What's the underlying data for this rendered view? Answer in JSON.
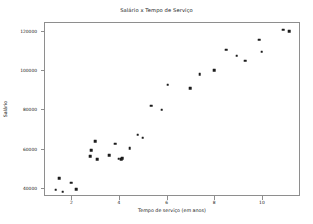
{
  "chart_data": {
    "type": "scatter",
    "title": "Salário x Tempo de Serviço",
    "xlabel": "Tempo de serviço (em anos)",
    "ylabel": "Salário",
    "xlim": [
      0.85,
      11.6
    ],
    "ylim": [
      36000,
      124500
    ],
    "grid": false,
    "legend": null,
    "marker": {
      "shape": "square",
      "color": "#1c1c1c",
      "size": 2.6
    },
    "xticks": [
      2,
      4,
      6,
      8,
      10
    ],
    "xtick_labels": [
      "2",
      "4",
      "6",
      "8",
      "10"
    ],
    "yticks": [
      40000,
      60000,
      80000,
      100000,
      120000
    ],
    "ytick_labels": [
      "40000",
      "60000",
      "80000",
      "100000",
      "120000"
    ],
    "series": [
      {
        "name": "funcionarios",
        "points": [
          {
            "x": 1.3,
            "y": 39800
          },
          {
            "x": 1.45,
            "y": 45600
          },
          {
            "x": 1.6,
            "y": 38600
          },
          {
            "x": 1.95,
            "y": 43300
          },
          {
            "x": 2.15,
            "y": 40000
          },
          {
            "x": 2.75,
            "y": 56700
          },
          {
            "x": 2.8,
            "y": 59900
          },
          {
            "x": 2.95,
            "y": 64400
          },
          {
            "x": 3.05,
            "y": 55100
          },
          {
            "x": 3.55,
            "y": 57300
          },
          {
            "x": 3.8,
            "y": 63200
          },
          {
            "x": 3.95,
            "y": 55400
          },
          {
            "x": 4.05,
            "y": 55300
          },
          {
            "x": 4.1,
            "y": 55600
          },
          {
            "x": 4.4,
            "y": 60800
          },
          {
            "x": 4.75,
            "y": 67600
          },
          {
            "x": 4.95,
            "y": 66100
          },
          {
            "x": 5.3,
            "y": 82500
          },
          {
            "x": 5.75,
            "y": 80400
          },
          {
            "x": 6.0,
            "y": 93200
          },
          {
            "x": 6.95,
            "y": 91200
          },
          {
            "x": 7.35,
            "y": 98600
          },
          {
            "x": 7.95,
            "y": 100400
          },
          {
            "x": 8.45,
            "y": 110900
          },
          {
            "x": 8.9,
            "y": 107900
          },
          {
            "x": 9.25,
            "y": 105400
          },
          {
            "x": 9.85,
            "y": 116000
          },
          {
            "x": 9.95,
            "y": 109900
          },
          {
            "x": 10.85,
            "y": 121100
          },
          {
            "x": 11.1,
            "y": 120400
          }
        ]
      }
    ]
  },
  "figure": {
    "background": "#ffffff",
    "spine_color": "#8e8e8e",
    "text_color": "#1a1a1a"
  }
}
